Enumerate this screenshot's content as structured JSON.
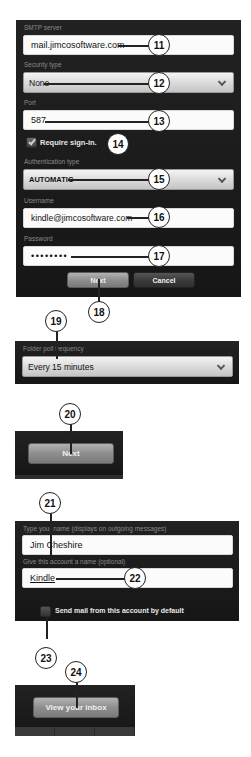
{
  "panel_server": {
    "smtp_server": {
      "label": "SMTP server",
      "value": "mail.jimcosoftware.com"
    },
    "security_type": {
      "label": "Security type",
      "value": "None"
    },
    "port": {
      "label": "Port",
      "value": "587"
    },
    "require_signin": {
      "label": "Require sign-in.",
      "checked": true
    },
    "auth_type": {
      "label": "Authentication type",
      "value": "AUTOMATIC"
    },
    "username": {
      "label": "Username",
      "value": "kindle@jimcosoftware.com"
    },
    "password": {
      "label": "Password",
      "value": "••••••••"
    },
    "buttons": {
      "next": "Next",
      "cancel": "Cancel"
    }
  },
  "panel_poll": {
    "frequency": {
      "label": "Folder poll frequency",
      "value": "Every 15 minutes"
    }
  },
  "panel_next": {
    "next": "Next"
  },
  "panel_account": {
    "your_name": {
      "label": "Type your name (displays on outgoing messages)",
      "value": "Jim Cheshire"
    },
    "account_name": {
      "label": "Give this account a name (optional)",
      "value": "Kindle"
    },
    "default_send": {
      "label": "Send mail from this account by default",
      "checked": false
    }
  },
  "panel_inbox": {
    "view_inbox": "View your inbox"
  },
  "callouts": [
    "11",
    "12",
    "13",
    "14",
    "15",
    "16",
    "17",
    "18",
    "19",
    "20",
    "21",
    "22",
    "23",
    "24"
  ]
}
